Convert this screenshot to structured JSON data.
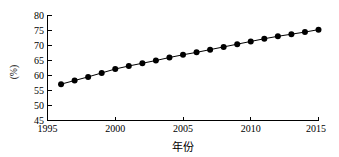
{
  "chart_data": {
    "type": "line",
    "title": "",
    "xlabel": "年份",
    "ylabel": "(%)",
    "xlim": [
      1995,
      2015
    ],
    "ylim": [
      45,
      80
    ],
    "grid": false,
    "legend": false,
    "marker": "filled-circle",
    "line_color": "#000000",
    "marker_color": "#000000",
    "x_ticks": [
      1995,
      2000,
      2005,
      2010,
      2015
    ],
    "y_ticks": [
      45,
      50,
      55,
      60,
      65,
      70,
      75,
      80
    ],
    "x": [
      1996,
      1997,
      1998,
      1999,
      2000,
      2001,
      2002,
      2003,
      2004,
      2005,
      2006,
      2007,
      2008,
      2009,
      2010,
      2011,
      2012,
      2013,
      2014,
      2015
    ],
    "values": [
      57.0,
      58.2,
      59.4,
      60.7,
      62.0,
      63.0,
      63.9,
      64.8,
      65.8,
      66.7,
      67.5,
      68.4,
      69.3,
      70.2,
      71.1,
      72.0,
      72.8,
      73.5,
      74.2,
      75.0
    ],
    "series": [
      {
        "name": "",
        "values": [
          57.0,
          58.2,
          59.4,
          60.7,
          62.0,
          63.0,
          63.9,
          64.8,
          65.8,
          66.7,
          67.5,
          68.4,
          69.3,
          70.2,
          71.1,
          72.0,
          72.8,
          73.5,
          74.2,
          75.0
        ]
      }
    ]
  },
  "axes": {
    "y_tick_labels": [
      "80",
      "75",
      "70",
      "65",
      "60",
      "55",
      "50",
      "45"
    ],
    "x_tick_labels": [
      "1995",
      "2000",
      "2005",
      "2010",
      "2015"
    ],
    "y_title": "(%)",
    "x_title": "年份"
  }
}
